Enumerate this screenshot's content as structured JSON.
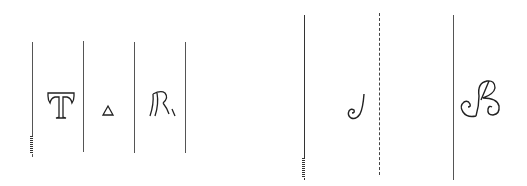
{
  "figure": {
    "left_panel": {
      "glyphs": [
        {
          "name": "letter-t",
          "char": "T"
        },
        {
          "name": "triangle",
          "char": "△"
        },
        {
          "name": "letter-r-ligature",
          "char": "R"
        }
      ],
      "line_color": "#555555"
    },
    "right_panel": {
      "glyphs": [
        {
          "name": "script-j",
          "char": "J"
        },
        {
          "name": "script-b",
          "char": "B"
        }
      ],
      "line_color": "#444444"
    }
  }
}
